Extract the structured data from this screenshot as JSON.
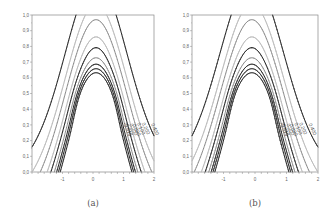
{
  "chart_data": [
    {
      "type": "contour",
      "caption": "(a)",
      "xlim": [
        -2,
        2
      ],
      "ylim": [
        0,
        1
      ],
      "xticks": [
        -1,
        0,
        1,
        2
      ],
      "xtick_labels": [
        "-1",
        "0",
        "1",
        "2"
      ],
      "yticks": [
        0,
        0.1,
        0.2,
        0.3,
        0.4,
        0.5,
        0.6,
        0.7,
        0.8,
        0.9,
        1.0
      ],
      "ytick_labels": [
        "0,0",
        "0,1",
        "0,2",
        "0,3",
        "0,4",
        "0,5",
        "0,6",
        "0,7",
        "0,8",
        "0,9",
        "1,0"
      ],
      "xminor_step": 0.2,
      "grid": false,
      "center": {
        "x": 0.1,
        "y": 0.36
      },
      "levels": [
        {
          "value": 0.4,
          "label": "0.400",
          "style": "solid-dark"
        },
        {
          "value": 0.2,
          "label": "0.200",
          "style": "dashed-light"
        },
        {
          "value": 0.1,
          "label": "0.100",
          "style": "solid-gray"
        },
        {
          "value": 0.02,
          "label": "0.020",
          "style": "dashed-light"
        },
        {
          "value": 0.0,
          "label": "0.000",
          "style": "solid-dark"
        },
        {
          "value": -0.005,
          "label": "",
          "style": "solid-gray"
        },
        {
          "value": -0.01,
          "label": "-0.010",
          "style": "solid-dark"
        },
        {
          "value": -0.015,
          "label": "-0.015",
          "style": "solid-dark"
        },
        {
          "value": -0.02,
          "label": "",
          "style": "solid-dark"
        }
      ]
    },
    {
      "type": "contour",
      "caption": "(b)",
      "xlim": [
        -2,
        2
      ],
      "ylim": [
        0,
        1
      ],
      "xticks": [
        -1,
        0,
        1,
        2
      ],
      "xtick_labels": [
        "-1",
        "0",
        "1",
        "2"
      ],
      "yticks": [
        0,
        0.1,
        0.2,
        0.3,
        0.4,
        0.5,
        0.6,
        0.7,
        0.8,
        0.9,
        1.0
      ],
      "ytick_labels": [
        "0,0",
        "0,1",
        "0,2",
        "0,3",
        "0,4",
        "0,5",
        "0,6",
        "0,7",
        "0,8",
        "0,9",
        "1,0"
      ],
      "xminor_step": 0.2,
      "grid": false,
      "center": {
        "x": -0.1,
        "y": 0.36
      },
      "levels": [
        {
          "value": 0.4,
          "label": "0.400",
          "style": "solid-dark"
        },
        {
          "value": 0.2,
          "label": "0.200",
          "style": "dashed-light"
        },
        {
          "value": 0.1,
          "label": "0.100",
          "style": "solid-gray"
        },
        {
          "value": 0.02,
          "label": "0.020",
          "style": "dashed-light"
        },
        {
          "value": 0.0,
          "label": "0.000",
          "style": "solid-dark"
        },
        {
          "value": -0.005,
          "label": "",
          "style": "solid-gray"
        },
        {
          "value": -0.01,
          "label": "-0.010",
          "style": "solid-dark"
        },
        {
          "value": -0.015,
          "label": "-0.015",
          "style": "solid-dark"
        },
        {
          "value": -0.02,
          "label": "",
          "style": "solid-dark"
        }
      ]
    }
  ],
  "colors": {
    "frame": "#888888",
    "dark": "#222222",
    "gray": "#777777",
    "light": "#bbbbbb"
  }
}
